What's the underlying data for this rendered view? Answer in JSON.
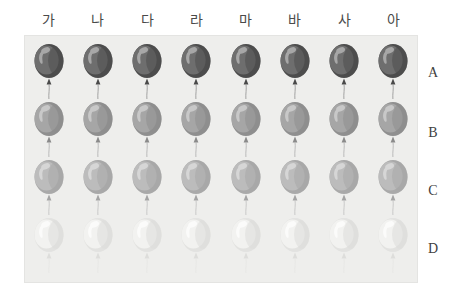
{
  "figure": {
    "title_visible": false,
    "panel_background": "#eeeeec",
    "page_background": "#ffffff"
  },
  "columns": {
    "labels": [
      "가",
      "나",
      "다",
      "라",
      "마",
      "바",
      "사",
      "아"
    ],
    "count": 8,
    "position": "top"
  },
  "rows": {
    "labels": [
      "A",
      "B",
      "C",
      "D"
    ],
    "count": 4,
    "position": "right"
  },
  "chart_data": {
    "type": "heatmap",
    "title": "",
    "xlabel": "",
    "ylabel": "",
    "categories": [
      "가",
      "나",
      "다",
      "라",
      "마",
      "바",
      "사",
      "아"
    ],
    "rows": [
      "A",
      "B",
      "C",
      "D"
    ],
    "grid": false,
    "legend": "none",
    "marker": "balloon",
    "series": [
      {
        "name": "A",
        "values": [
          1,
          1,
          1,
          1,
          1,
          1,
          1,
          1
        ]
      },
      {
        "name": "B",
        "values": [
          2,
          2,
          2,
          2,
          2,
          2,
          2,
          2
        ]
      },
      {
        "name": "C",
        "values": [
          3,
          3,
          3,
          3,
          3,
          3,
          3,
          3
        ]
      },
      {
        "name": "D",
        "values": [
          4,
          4,
          4,
          4,
          4,
          4,
          4,
          4
        ]
      }
    ]
  },
  "balloon_styles": {
    "A": {
      "row_label": "A",
      "shade_name": "dark-gray",
      "outline": "#4c4c4c",
      "body": "#6e6e6e",
      "shadow": "#4f4f4f",
      "highlight": "#a7a7a7",
      "knot": "#4a4a4a",
      "string": "#9a9a9a"
    },
    "B": {
      "row_label": "B",
      "shade_name": "medium-gray",
      "outline": "#8f8f8f",
      "body": "#a6a6a6",
      "shadow": "#8e8e8e",
      "highlight": "#c8c8c8",
      "knot": "#8a8a8a",
      "string": "#b4b4b4"
    },
    "C": {
      "row_label": "C",
      "shade_name": "light-gray",
      "outline": "#a9a9a9",
      "body": "#bcbcbc",
      "shadow": "#a7a7a7",
      "highlight": "#d6d6d6",
      "knot": "#a4a4a4",
      "string": "#c4c4c4"
    },
    "D": {
      "row_label": "D",
      "shade_name": "near-white",
      "outline": "#e2e2e0",
      "body": "#f2f2f0",
      "shadow": "#dcdcda",
      "highlight": "#fbfbfa",
      "knot": "#dddddb",
      "string": "#e6e6e4"
    }
  }
}
